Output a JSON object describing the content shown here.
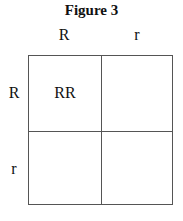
{
  "figure": {
    "title": "Figure 3",
    "column_headers": [
      "R",
      "r"
    ],
    "row_headers": [
      "R",
      "r"
    ],
    "cells": [
      [
        "RR",
        ""
      ],
      [
        "",
        ""
      ]
    ]
  }
}
